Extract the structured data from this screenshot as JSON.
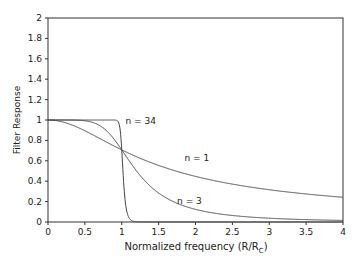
{
  "chart_data": {
    "type": "line",
    "title": "",
    "xlabel": "Normalized frequency (R/R",
    "xlabel_sub": "C",
    "xlabel_close": ")",
    "ylabel": "Filter Response",
    "xlim": [
      0,
      4
    ],
    "ylim": [
      0,
      2
    ],
    "x_ticks": [
      0,
      0.5,
      1,
      1.5,
      2,
      2.5,
      3,
      3.5,
      4
    ],
    "x_tick_labels": [
      "0",
      "0.5",
      "1",
      "1.5",
      "2",
      "2.5",
      "3",
      "3.5",
      "4"
    ],
    "y_ticks": [
      0,
      0.2,
      0.4,
      0.6,
      0.8,
      1,
      1.2,
      1.4,
      1.6,
      1.8,
      2
    ],
    "y_tick_labels": [
      "0",
      "0.2",
      "0.4",
      "0.6",
      "0.8",
      "1",
      "1.2",
      "1.4",
      "1.6",
      "1.8",
      "2"
    ],
    "grid": false,
    "legend": "inline annotations",
    "series": [
      {
        "name": "n = 1",
        "order": 1,
        "x": [
          0,
          0.5,
          1,
          1.5,
          2,
          2.5,
          3,
          3.5,
          4
        ],
        "values": [
          1.0,
          0.894,
          0.707,
          0.555,
          0.447,
          0.371,
          0.316,
          0.275,
          0.243
        ]
      },
      {
        "name": "n = 3",
        "order": 3,
        "x": [
          0,
          0.5,
          1,
          1.5,
          2,
          2.5,
          3,
          3.5,
          4
        ],
        "values": [
          1.0,
          0.992,
          0.707,
          0.284,
          0.124,
          0.064,
          0.037,
          0.023,
          0.016
        ]
      },
      {
        "name": "n = 34",
        "order": 34,
        "x": [
          0,
          0.5,
          0.95,
          1,
          1.05,
          1.1,
          1.5,
          4
        ],
        "values": [
          1.0,
          1.0,
          0.985,
          0.707,
          0.189,
          0.039,
          0.0,
          0.0
        ]
      }
    ],
    "annotations": [
      {
        "text": "n = 34",
        "x": 1.05,
        "y": 0.96
      },
      {
        "text": "n = 1",
        "x": 1.85,
        "y": 0.6
      },
      {
        "text": "n = 3",
        "x": 1.75,
        "y": 0.18
      }
    ]
  }
}
